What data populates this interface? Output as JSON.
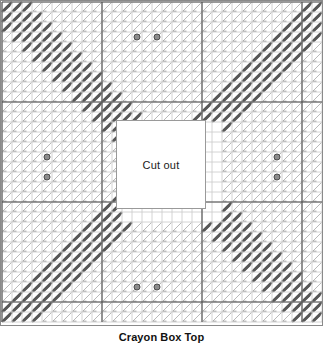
{
  "document": {
    "title": "Crayon Box Top",
    "caption": "Crayon Box Top",
    "kind": "plastic-canvas-stitch-chart"
  },
  "chart_frame": {
    "border_color": "#8a8a8a",
    "background": "#ffffff",
    "width_px": 323,
    "height_px": 326
  },
  "cutout": {
    "label": "Cut out",
    "border_color": "#9a9a9a",
    "fill": "#ffffff",
    "x": 115,
    "y": 119,
    "width": 90,
    "height": 89
  },
  "grid": {
    "cols": 32,
    "rows": 32,
    "cell_px": 10.0,
    "origin_x": 1,
    "origin_y": 1,
    "light_line_color": "#c9c9c9",
    "heavy_line_color": "#4a4a4a",
    "heavy_every": 10
  },
  "legend": {
    "stitch_light_color": "#b9b9b9",
    "stitch_dark_color": "#575757",
    "stitch_mid_color": "#8e8e8e",
    "bead_fill": "#8c8c8c",
    "bead_stroke": "#4a4a4a"
  },
  "chart_data": {
    "type": "heatmap",
    "title": "Crayon Box Top",
    "xlabel": "",
    "ylabel": "",
    "grid": true,
    "legend": "none",
    "value_labels": {
      "0": "light stitch",
      "1": "dark stitch",
      "2": "cut out"
    },
    "categories_x": [
      1,
      2,
      3,
      4,
      5,
      6,
      7,
      8,
      9,
      10,
      11,
      12,
      13,
      14,
      15,
      16,
      17,
      18,
      19,
      20,
      21,
      22,
      23,
      24,
      25,
      26,
      27,
      28,
      29,
      30,
      31,
      32
    ],
    "categories_y": [
      1,
      2,
      3,
      4,
      5,
      6,
      7,
      8,
      9,
      10,
      11,
      12,
      13,
      14,
      15,
      16,
      17,
      18,
      19,
      20,
      21,
      22,
      23,
      24,
      25,
      26,
      27,
      28,
      29,
      30,
      31,
      32
    ],
    "dark_band_rule": "cell is dark when |(|c-15.5| - |r-15.5|)| <= 2.5 and max(|c-15.5|,|r-15.5|) >= 5.5",
    "beads": [
      {
        "col": 14,
        "row": 4
      },
      {
        "col": 16,
        "row": 4
      },
      {
        "col": 5,
        "row": 16
      },
      {
        "col": 5,
        "row": 18
      },
      {
        "col": 28,
        "row": 16
      },
      {
        "col": 28,
        "row": 18
      },
      {
        "col": 14,
        "row": 29
      },
      {
        "col": 16,
        "row": 29
      }
    ],
    "cutout_cells": {
      "col_start": 12,
      "col_end": 21,
      "row_start": 12,
      "row_end": 21
    }
  }
}
